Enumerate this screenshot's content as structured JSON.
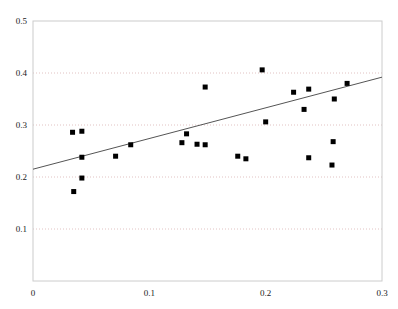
{
  "chart_data": {
    "type": "scatter",
    "title": "",
    "subtitle": "",
    "xlabel": "",
    "ylabel": "",
    "xlim": [
      0,
      0.3
    ],
    "ylim": [
      0,
      0.5
    ],
    "xticks": [
      0,
      0.1,
      0.2,
      0.3
    ],
    "xtick_labels": [
      "0",
      "0.1",
      "0.2",
      "0.3"
    ],
    "yticks": [
      0,
      0.1,
      0.2,
      0.3,
      0.4,
      0.5
    ],
    "ytick_labels": [
      "0",
      "0.1",
      "0.2",
      "0.3",
      "0.4",
      "0.5"
    ],
    "grid": {
      "horizontal": true,
      "vertical": false,
      "style": "dotted",
      "color": "#d9b3b3",
      "levels": [
        0.1,
        0.2,
        0.3,
        0.4
      ]
    },
    "legend": null,
    "marker": {
      "shape": "square",
      "color": "#000000",
      "size": 5
    },
    "series": [
      {
        "name": "observations",
        "points": [
          {
            "x": 0.034,
            "y": 0.286
          },
          {
            "x": 0.042,
            "y": 0.288
          },
          {
            "x": 0.042,
            "y": 0.238
          },
          {
            "x": 0.042,
            "y": 0.198
          },
          {
            "x": 0.035,
            "y": 0.172
          },
          {
            "x": 0.071,
            "y": 0.24
          },
          {
            "x": 0.084,
            "y": 0.262
          },
          {
            "x": 0.128,
            "y": 0.266
          },
          {
            "x": 0.132,
            "y": 0.283
          },
          {
            "x": 0.141,
            "y": 0.263
          },
          {
            "x": 0.148,
            "y": 0.262
          },
          {
            "x": 0.176,
            "y": 0.24
          },
          {
            "x": 0.183,
            "y": 0.235
          },
          {
            "x": 0.148,
            "y": 0.373
          },
          {
            "x": 0.197,
            "y": 0.406
          },
          {
            "x": 0.2,
            "y": 0.306
          },
          {
            "x": 0.224,
            "y": 0.363
          },
          {
            "x": 0.237,
            "y": 0.369
          },
          {
            "x": 0.27,
            "y": 0.38
          },
          {
            "x": 0.233,
            "y": 0.33
          },
          {
            "x": 0.259,
            "y": 0.35
          },
          {
            "x": 0.258,
            "y": 0.268
          },
          {
            "x": 0.237,
            "y": 0.237
          },
          {
            "x": 0.257,
            "y": 0.223
          }
        ]
      }
    ],
    "trendline": {
      "type": "linear-fit",
      "color": "#555555",
      "x_start": 0.0,
      "y_start": 0.215,
      "x_end": 0.3,
      "y_end": 0.392
    }
  },
  "axes": {
    "frame_color": "#cccccc",
    "background": "#ffffff"
  }
}
